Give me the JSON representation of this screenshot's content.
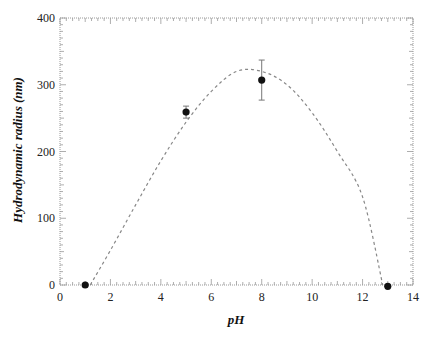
{
  "chart_data": {
    "type": "scatter",
    "title": "",
    "xlabel": "pH",
    "ylabel": "Hydrodynamic radius (nm)",
    "xlim": [
      0,
      14
    ],
    "ylim": [
      0,
      400
    ],
    "x_ticks": [
      0,
      2,
      4,
      6,
      8,
      10,
      12,
      14
    ],
    "y_ticks": [
      0,
      100,
      200,
      300,
      400
    ],
    "grid": false,
    "legend": null,
    "series": [
      {
        "name": "measured",
        "style": "markers with error bars",
        "color": "#111111",
        "points": [
          {
            "x": 1,
            "y": 0,
            "err": 0
          },
          {
            "x": 5,
            "y": 259,
            "err": 9
          },
          {
            "x": 8,
            "y": 307,
            "err": 30
          },
          {
            "x": 13,
            "y": -2,
            "err": 0
          }
        ]
      },
      {
        "name": "fit",
        "style": "dashed line",
        "color": "#888888",
        "x": [
          1.2,
          2,
          3,
          4,
          5,
          6,
          7,
          8,
          9,
          10,
          11,
          12,
          12.8
        ],
        "values": [
          0,
          52,
          120,
          186,
          244,
          290,
          320,
          320,
          300,
          258,
          200,
          132,
          0
        ]
      }
    ]
  }
}
